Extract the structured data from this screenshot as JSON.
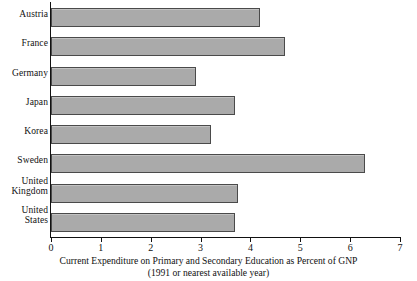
{
  "chart_data": {
    "type": "bar",
    "orientation": "horizontal",
    "title": "",
    "categories": [
      "Austria",
      "France",
      "Germany",
      "Japan",
      "Korea",
      "Sweden",
      "United Kingdom",
      "United States"
    ],
    "values": [
      4.2,
      4.7,
      2.9,
      3.7,
      3.2,
      6.3,
      3.75,
      3.7
    ],
    "xlabel": "Current Expenditure on Primary and Secondary Education as Percent of GNP",
    "xlabel_line2": "(1991 or nearest available year)",
    "ylabel": "",
    "xlim": [
      0,
      7
    ],
    "xticks": [
      0,
      1,
      2,
      3,
      4,
      5,
      6,
      7
    ],
    "xtick_labels": [
      "0",
      "1",
      "2",
      "3",
      "4",
      "5",
      "6",
      "7"
    ],
    "grid": false,
    "legend": false,
    "bar_color": "#aaaaaa",
    "bar_border_color": "#4a4a4a",
    "axis_color": "#111111"
  },
  "caption": {
    "line1": "Current Expenditure on Primary and Secondary Education as Percent of GNP",
    "line2": "(1991 or nearest available year)"
  }
}
